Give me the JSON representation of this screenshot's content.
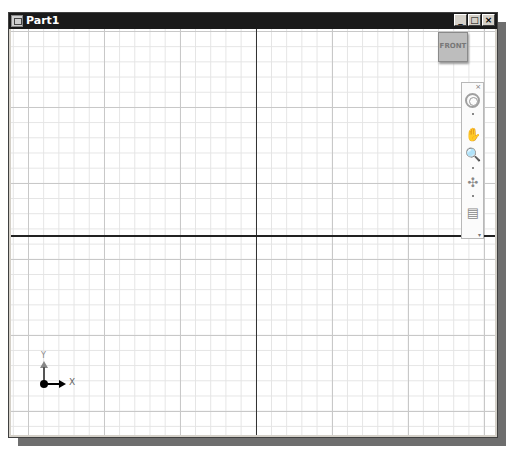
{
  "window": {
    "title": "Part1",
    "controls": {
      "minimize": "_",
      "maximize": "□",
      "close": "×"
    }
  },
  "viewcube": {
    "label": "FRONT"
  },
  "navigation_bar": {
    "close": "×",
    "tools": [
      {
        "name": "steering-wheel",
        "glyph": ""
      },
      {
        "name": "pan",
        "glyph": "✋"
      },
      {
        "name": "zoom",
        "glyph": "🔍"
      },
      {
        "name": "orbit",
        "glyph": "✣"
      },
      {
        "name": "look-at",
        "glyph": "▤"
      }
    ],
    "customize": "▾"
  },
  "triad": {
    "x_label": "X",
    "y_label": "Y"
  }
}
